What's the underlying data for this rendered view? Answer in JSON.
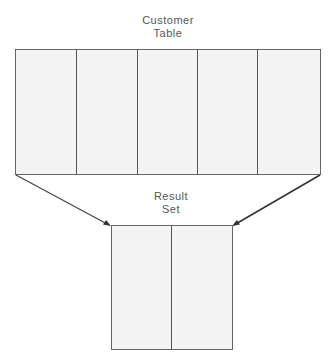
{
  "diagram": {
    "source_table": {
      "title_line1": "Customer",
      "title_line2": "Table",
      "column_count": 5
    },
    "result_table": {
      "title_line1": "Result",
      "title_line2": "Set",
      "column_count": 2
    },
    "colors": {
      "cell_fill": "#f4f4f4",
      "line": "#555555",
      "arrow": "#333333",
      "text": "#555555",
      "background": "#ffffff"
    }
  }
}
